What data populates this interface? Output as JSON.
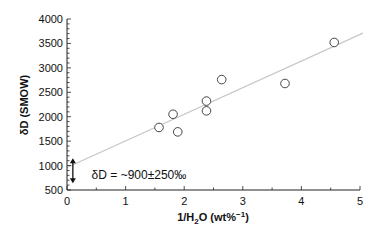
{
  "chart_data": {
    "type": "scatter",
    "title": "",
    "xlabel": "1/H₂O (wt%⁻¹)",
    "ylabel": "δD (SMOW)",
    "xlim": [
      0,
      5
    ],
    "ylim": [
      500,
      4000
    ],
    "x_ticks": [
      "0",
      "1",
      "2",
      "3",
      "4",
      "5"
    ],
    "y_ticks": [
      "500",
      "1000",
      "1500",
      "2000",
      "2500",
      "3000",
      "3500",
      "4000"
    ],
    "grid": false,
    "legend": null,
    "series": [
      {
        "name": "samples",
        "marker": "open-circle",
        "points": [
          {
            "x": 1.57,
            "y": 1780
          },
          {
            "x": 1.81,
            "y": 2050
          },
          {
            "x": 1.89,
            "y": 1690
          },
          {
            "x": 2.38,
            "y": 2320
          },
          {
            "x": 2.38,
            "y": 2120
          },
          {
            "x": 2.64,
            "y": 2760
          },
          {
            "x": 3.72,
            "y": 2680
          },
          {
            "x": 4.56,
            "y": 3520
          }
        ]
      }
    ],
    "fit_line": {
      "x": [
        0,
        5.05
      ],
      "y": [
        960,
        3710
      ],
      "color": "#c8c8c8"
    },
    "annotations": [
      {
        "text": "δD = ~900±250‰",
        "x": 0.42,
        "y": 800
      },
      {
        "type": "double-arrow",
        "x": 0.1,
        "y_from": 640,
        "y_to": 1150
      }
    ]
  }
}
